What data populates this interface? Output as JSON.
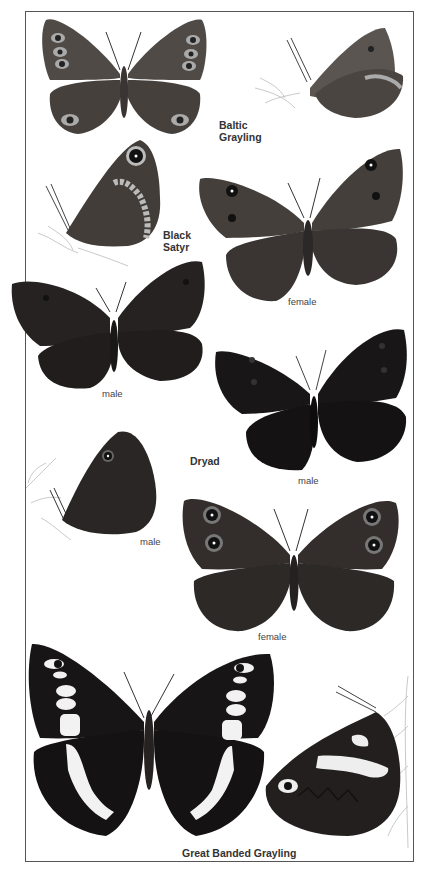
{
  "plate": {
    "species": [
      {
        "name": "Baltic\nGrayling",
        "views": [
          "upperside",
          "underside"
        ]
      },
      {
        "name": "Black\nSatyr",
        "views": [
          "underside",
          "female",
          "male"
        ]
      },
      {
        "name": "Dryad",
        "views": [
          "male",
          "male-underside",
          "female"
        ]
      },
      {
        "name": "Great Banded Grayling",
        "views": [
          "upperside",
          "underside"
        ]
      }
    ],
    "labels": {
      "baltic": "Baltic\nGrayling",
      "black_satyr": "Black\nSatyr",
      "dryad": "Dryad",
      "great_banded": "Great Banded Grayling"
    },
    "captions": {
      "satyr_female": "female",
      "satyr_male": "male",
      "dryad_male": "male",
      "dryad_under_male": "male",
      "dryad_female": "female"
    },
    "colors": {
      "wing_brown": "#4a4540",
      "wing_dark": "#242121",
      "wing_black": "#161414",
      "band_white": "#f2f2f2",
      "border": "#555555"
    }
  }
}
